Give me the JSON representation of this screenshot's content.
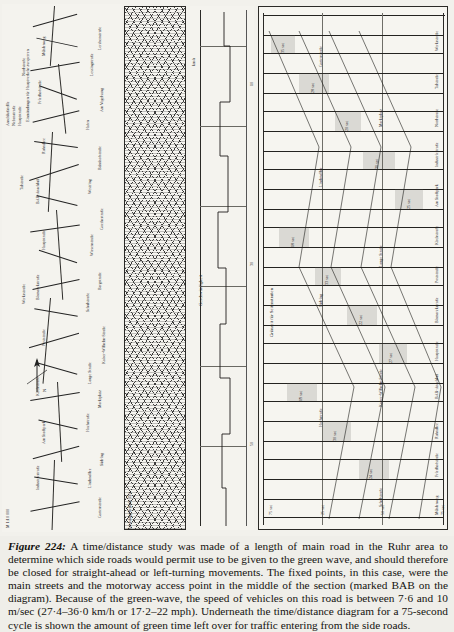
{
  "figure": {
    "caption_number": "Figure 224:",
    "caption_text": " A time/distance study was made of a length of main road in the Ruhr area to determine which side roads would permit use to be given to the green wave, and should therefore be closed for straight-ahead or left-turning movements. The fixed points, in this case, were the main streets and the motorway access point in the middle of the section (marked BAB on the diagram). Because of the green-wave, the speed of vehicles on this road is between 7·6 and 10 m/sec (27·4–36·0 km/h or 17·2–22 mph). Underneath the time/distance diagram for a 75-second cycle is shown the amount of green time left over for traffic entering from the side roads.",
    "scale_label": "M 1:10 000"
  },
  "map_panel": {
    "name": "Ruhr main road map",
    "compass_label": "N",
    "road_labels": [
      "Lerchenstraße",
      "Lessingstraße",
      "Am Vogelsang",
      "Hafen",
      "Bahnhofstraße",
      "Westring",
      "Goethestraße",
      "Wiesenstraße",
      "Bergstraße",
      "Schulstraße",
      "Kaiser-Wilhelm-Straße",
      "Lange Straße",
      "Marktplatz",
      "Hochstraße",
      "Südring",
      "Lindenallee",
      "Gartenstraße",
      "Mühlenweg",
      "Friedhofstraße",
      "Ruhrallee",
      "BAB-Anschluß",
      "Hauptstraße",
      "Bismarckstraße",
      "Poststraße",
      "Kirchstraße",
      "Am Stadtpark",
      "Industriestraße",
      "Nordstraße",
      "Talstraße",
      "Werksstraße"
    ],
    "legend": [
      "Einmündungen für Hauptverkehr zu sperren",
      "Hauptstraße",
      "Nebenstraße",
      "Anschlußstelle"
    ]
  },
  "hatch_panel": {
    "name": "Bebauungsdichte / built-up area hatching"
  },
  "speed_panel": {
    "axis_title": "Geschwindigkeit",
    "axis_ticks": [
      "0",
      "10",
      "20",
      "30",
      "40",
      "50"
    ],
    "unit": "km/h"
  },
  "green_panel": {
    "title": "Grünzeit für Seitenstraßen",
    "cycle_label": "75 sec",
    "time_marks": [
      "0 sec",
      "25 sec",
      "50 sec",
      "75 sec"
    ],
    "distance_axis_label": "Entfernung",
    "bottom_axis_label": "Bebauung   Verkehr   Zeit",
    "band_labels": [
      "35 sec",
      "28 sec",
      "20 sec",
      "31 sec",
      "25 sec",
      "18 sec",
      "33 sec",
      "22 sec",
      "27 sec",
      "19 sec",
      "30 sec",
      "24 sec"
    ],
    "street_labels": [
      "Werksstraße",
      "Talstraße",
      "Nordstraße",
      "Industriestraße",
      "Am Stadtpark",
      "Kirchstraße",
      "Poststraße",
      "Bismarckstraße",
      "Hauptstraße",
      "BAB-Anschluß",
      "Ruhrallee",
      "Friedhofstraße",
      "Mühlenweg",
      "Gartenstraße",
      "Lindenallee",
      "Südring",
      "Hochstraße",
      "Marktplatz",
      "Lange Straße",
      "Kaiser-Wilhelm-Straße",
      "Schulstraße",
      "Bergstraße",
      "Wiesenstraße",
      "Goethestraße",
      "Westring",
      "Bahnhofstraße",
      "Hafen",
      "Am Vogelsang",
      "Lessingstraße",
      "Lerchenstraße"
    ]
  }
}
